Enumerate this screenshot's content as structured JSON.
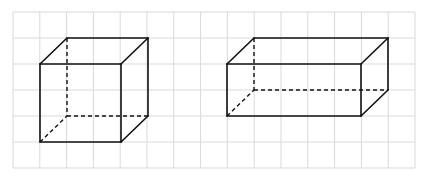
{
  "diagram": {
    "type": "isometric-grid-solids",
    "background": "#ffffff",
    "grid": {
      "x0": 13,
      "y0": 12,
      "cell_w": 26.8,
      "cell_h": 26,
      "cols": 15,
      "rows": 6,
      "color": "#d9d9d9"
    },
    "stroke": {
      "color": "#111111",
      "width": 1.6,
      "dash": "4 3"
    },
    "solids": [
      {
        "name": "cube",
        "front": {
          "x": 40,
          "y": 64,
          "w": 81,
          "h": 78
        },
        "depth": {
          "dx": 27,
          "dy": -26
        }
      },
      {
        "name": "rectangular-prism",
        "front": {
          "x": 227,
          "y": 64,
          "w": 134,
          "h": 52
        },
        "depth": {
          "dx": 27,
          "dy": -26
        }
      }
    ]
  }
}
